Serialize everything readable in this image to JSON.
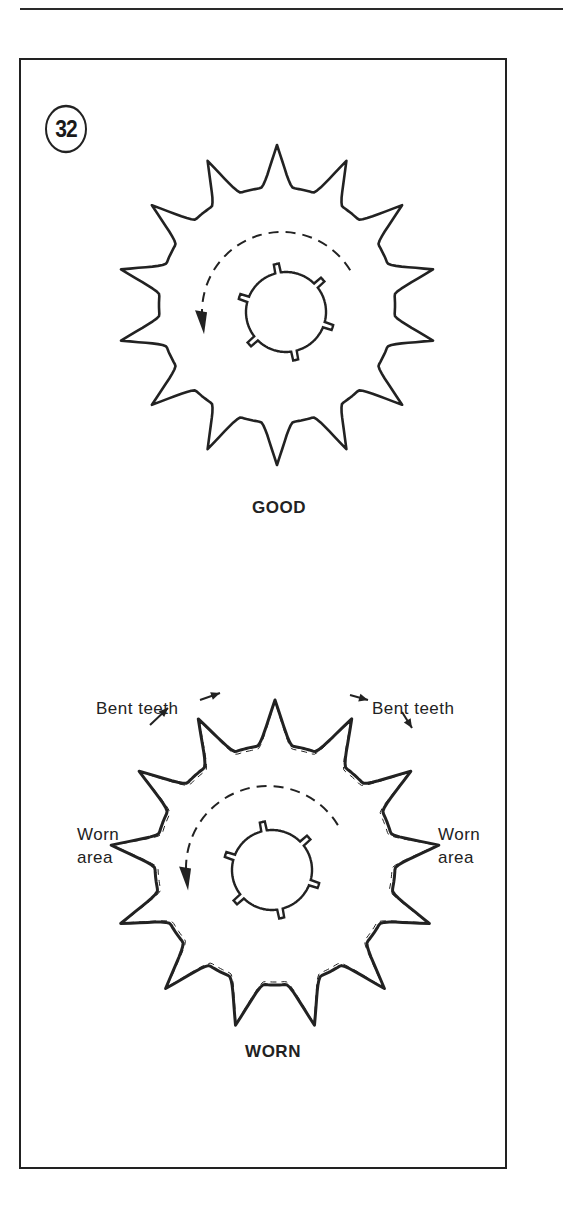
{
  "figure": {
    "number": "32",
    "panels": [
      {
        "id": "good",
        "caption": "GOOD"
      },
      {
        "id": "worn",
        "caption": "WORN",
        "annotations": {
          "bent_teeth_left": "Bent teeth",
          "bent_teeth_right": "Bent teeth",
          "worn_area_left": [
            "Worn",
            "area"
          ],
          "worn_area_right": [
            "Worn",
            "area"
          ]
        }
      }
    ]
  },
  "colors": {
    "ink": "#222222",
    "paper": "#ffffff"
  }
}
